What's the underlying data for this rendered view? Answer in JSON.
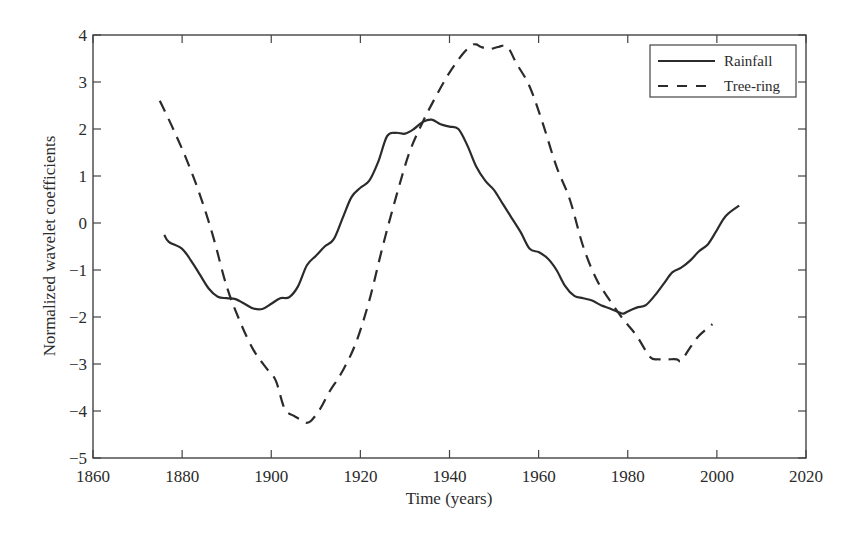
{
  "chart_data": {
    "type": "line",
    "title": "",
    "xlabel": "Time (years)",
    "ylabel": "Normalized wavelet coefficients",
    "xlim": [
      1860,
      2020
    ],
    "ylim": [
      -5,
      4
    ],
    "xticks": [
      1860,
      1880,
      1900,
      1920,
      1940,
      1960,
      1980,
      2000,
      2020
    ],
    "yticks": [
      4,
      3,
      2,
      1,
      0,
      -1,
      -2,
      -3,
      -4,
      -5
    ],
    "grid": false,
    "legend_position": "upper right",
    "series": [
      {
        "name": "Rainfall",
        "style": "solid",
        "x": [
          1876,
          1877,
          1880,
          1882,
          1884,
          1886,
          1888,
          1890,
          1892,
          1894,
          1896,
          1898,
          1900,
          1902,
          1904,
          1906,
          1908,
          1910,
          1912,
          1914,
          1916,
          1918,
          1920,
          1922,
          1924,
          1926,
          1928,
          1930,
          1932,
          1934,
          1936,
          1938,
          1940,
          1942,
          1944,
          1946,
          1948,
          1950,
          1952,
          1954,
          1956,
          1958,
          1960,
          1962,
          1964,
          1966,
          1968,
          1970,
          1972,
          1974,
          1976,
          1978,
          1979,
          1980,
          1982,
          1984,
          1986,
          1988,
          1990,
          1992,
          1994,
          1996,
          1998,
          2000,
          2002,
          2005
        ],
        "values": [
          -0.25,
          -0.4,
          -0.55,
          -0.8,
          -1.1,
          -1.4,
          -1.57,
          -1.6,
          -1.62,
          -1.72,
          -1.82,
          -1.83,
          -1.72,
          -1.6,
          -1.58,
          -1.35,
          -0.9,
          -0.7,
          -0.5,
          -0.35,
          0.1,
          0.55,
          0.75,
          0.9,
          1.3,
          1.85,
          1.92,
          1.9,
          2.0,
          2.15,
          2.2,
          2.1,
          2.05,
          2.0,
          1.65,
          1.2,
          0.9,
          0.7,
          0.4,
          0.1,
          -0.2,
          -0.55,
          -0.62,
          -0.75,
          -1.0,
          -1.35,
          -1.55,
          -1.6,
          -1.65,
          -1.75,
          -1.82,
          -1.9,
          -1.93,
          -1.88,
          -1.8,
          -1.75,
          -1.55,
          -1.3,
          -1.05,
          -0.95,
          -0.8,
          -0.6,
          -0.45,
          -0.15,
          0.15,
          0.37
        ]
      },
      {
        "name": "Tree-ring",
        "style": "dashed",
        "x": [
          1875,
          1878,
          1881,
          1884,
          1887,
          1890,
          1893,
          1896,
          1899,
          1901,
          1903,
          1905,
          1907,
          1908,
          1909,
          1911,
          1913,
          1916,
          1919,
          1922,
          1925,
          1928,
          1931,
          1934,
          1937,
          1940,
          1943,
          1945,
          1946,
          1947,
          1949,
          1951,
          1953,
          1955,
          1958,
          1961,
          1964,
          1967,
          1970,
          1973,
          1976,
          1979,
          1982,
          1985,
          1987,
          1989,
          1991,
          1992,
          1994,
          1996,
          1999
        ],
        "values": [
          2.6,
          2.0,
          1.35,
          0.6,
          -0.3,
          -1.35,
          -2.1,
          -2.7,
          -3.1,
          -3.35,
          -3.95,
          -4.1,
          -4.2,
          -4.25,
          -4.2,
          -3.95,
          -3.6,
          -3.15,
          -2.55,
          -1.65,
          -0.5,
          0.55,
          1.5,
          2.15,
          2.7,
          3.2,
          3.6,
          3.78,
          3.8,
          3.75,
          3.7,
          3.75,
          3.75,
          3.4,
          2.9,
          2.1,
          1.2,
          0.5,
          -0.5,
          -1.2,
          -1.65,
          -2.05,
          -2.4,
          -2.85,
          -2.9,
          -2.9,
          -2.9,
          -2.93,
          -2.65,
          -2.4,
          -2.15
        ]
      }
    ]
  },
  "legend": {
    "items": [
      {
        "label": "Rainfall",
        "style": "solid"
      },
      {
        "label": "Tree-ring",
        "style": "dashed"
      }
    ]
  },
  "colors": {
    "line": "#2b2b2b",
    "axis": "#444444",
    "background": "#ffffff"
  }
}
